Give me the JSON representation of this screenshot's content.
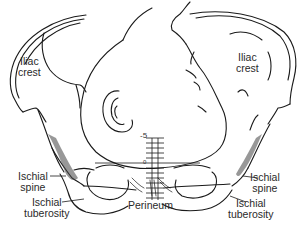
{
  "diagram": {
    "labels": {
      "iliac_crest_left": [
        "Iliac",
        "crest"
      ],
      "iliac_crest_right": [
        "Iliac",
        "crest"
      ],
      "ischial_spine_left": [
        "Ischial",
        "spine"
      ],
      "ischial_spine_right": [
        "Ischial",
        "spine"
      ],
      "ischial_tuberosity_left": [
        "Ischial",
        "tuberosity"
      ],
      "ischial_tuberosity_right": [
        "Ischial",
        "tuberosity"
      ],
      "perineum": "Perineum"
    },
    "station_scale": {
      "top_label": "-5",
      "zero_label": "0",
      "range": [
        -5,
        5
      ],
      "ticks": [
        -5,
        -4,
        -3,
        -2,
        -1,
        0,
        1,
        2,
        3,
        4,
        5
      ]
    },
    "colors": {
      "line": "#1a1a1a",
      "text": "#2a2a2a",
      "background": "#ffffff",
      "shade": "#555555"
    }
  }
}
